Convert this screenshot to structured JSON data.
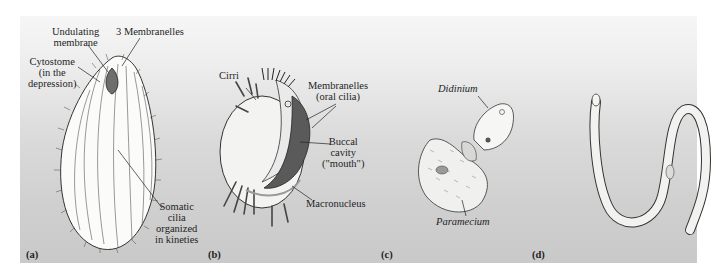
{
  "figure": {
    "panels": [
      {
        "letter": "(a)",
        "labels": {
          "undulating_membrane": [
            "Undulating",
            "membrane"
          ],
          "membranelles": "3 Membranelles",
          "cytostome": [
            "Cytostome",
            "(in the",
            "depression)"
          ],
          "somatic_cilia": [
            "Somatic",
            "cilia",
            "organized",
            "in kineties"
          ]
        }
      },
      {
        "letter": "(b)",
        "labels": {
          "cirri": "Cirri",
          "membranelles": [
            "Membranelles",
            "(oral cilia)"
          ],
          "buccal_cavity": [
            "Buccal",
            "cavity",
            "(\"mouth\")"
          ],
          "macronucleus": "Macronucleus"
        }
      },
      {
        "letter": "(c)",
        "labels": {
          "didinium": "Didinium",
          "paramecium": "Paramecium"
        }
      },
      {
        "letter": "(d)",
        "labels": {}
      }
    ],
    "colors": {
      "background_top": "#f6f6f6",
      "background_bottom": "#c9c9c9",
      "text": "#1e1e1e",
      "line": "#2a2a2a"
    }
  }
}
